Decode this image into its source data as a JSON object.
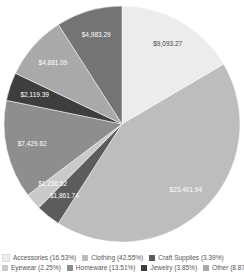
{
  "chart_data": {
    "type": "pie",
    "title": "",
    "start_angle_deg": 0,
    "direction": "clockwise",
    "slices": [
      {
        "category": "Accessories",
        "value": 9093.27,
        "label": "$9,093.27",
        "percent": 16.53,
        "color": "#ececec",
        "label_color": "#444444"
      },
      {
        "category": "Clothing",
        "value": 23401.94,
        "label": "$23,401.94",
        "percent": 42.55,
        "color": "#bdbdbd",
        "label_color": "#ffffff"
      },
      {
        "category": "Craft Supplies",
        "value": 1861.74,
        "label": "$1,861.74",
        "percent": 3.39,
        "color": "#5c5c5c",
        "label_color": "#ffffff"
      },
      {
        "category": "Eyewear",
        "value": 1236.52,
        "label": "$1,236.52",
        "percent": 2.25,
        "color": "#c9c9c9",
        "label_color": "#ffffff"
      },
      {
        "category": "Homeware",
        "value": 7429.62,
        "label": "$7,429.62",
        "percent": 13.51,
        "color": "#8e8e8e",
        "label_color": "#ffffff"
      },
      {
        "category": "Jewelry",
        "value": 2119.39,
        "label": "$2,119.39",
        "percent": 3.85,
        "color": "#3e3e3e",
        "label_color": "#ffffff"
      },
      {
        "category": "Other",
        "value": 4881.09,
        "label": "$4,881.09",
        "percent": 8.87,
        "color": "#a9a9a9",
        "label_color": "#ffffff"
      },
      {
        "category": "Paper",
        "value": 4983.29,
        "label": "$4,983.29",
        "percent": 9.06,
        "color": "#747474",
        "label_color": "#ffffff"
      }
    ],
    "legend_position": "bottom",
    "legend_rows": [
      [
        "Accessories (16.53%)",
        "Clothing (42.55%)",
        "Craft Supplies (3.39%)"
      ],
      [
        "Eyewear (2.25%)",
        "Homeware (13.51%)",
        "Jewelry (3.85%)",
        "Other (8.87%)"
      ]
    ]
  }
}
